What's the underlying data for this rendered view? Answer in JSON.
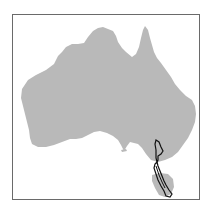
{
  "map": {
    "subject": "Australia distribution map",
    "land_color": "#b9b9b9",
    "outline_color": "#111111",
    "frame_color": "#6a6a6a",
    "background": "#ffffff",
    "highlighted_range": "south-eastern Australia (Victoria) to Tasmania"
  }
}
